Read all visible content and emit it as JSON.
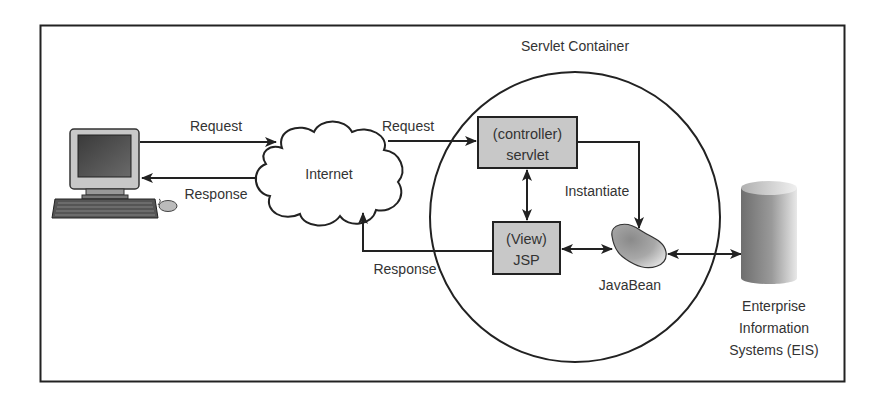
{
  "diagram": {
    "title": "Servlet Container",
    "nodes": {
      "client": {
        "label": "",
        "icon": "desktop-computer-icon"
      },
      "internet": {
        "label": "Internet"
      },
      "controller": {
        "line1": "(controller)",
        "line2": "servlet"
      },
      "view": {
        "line1": "(View)",
        "line2": "JSP"
      },
      "bean": {
        "label": "JavaBean"
      },
      "eis": {
        "line1": "Enterprise",
        "line2": "Information",
        "line3": "Systems (EIS)"
      }
    },
    "edges": {
      "client_to_internet": "Request",
      "internet_to_client": "Response",
      "internet_to_controller": "Request",
      "view_to_internet": "Response",
      "controller_to_bean": "Instantiate"
    },
    "colors": {
      "box_fill": "#c8c8c8",
      "stroke": "#222222",
      "text": "#333333"
    }
  }
}
